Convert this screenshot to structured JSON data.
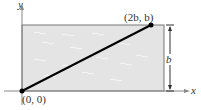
{
  "diagram": {
    "axes": {
      "x_label": "x",
      "y_label": "y"
    },
    "points": [
      {
        "label": "(0, 0)",
        "x": "0",
        "y": "0"
      },
      {
        "label": "(2b, b)",
        "x": "2b",
        "y": "b"
      }
    ],
    "dimension_label": "b",
    "colors": {
      "fill": "#e4e4e4",
      "line": "#000000",
      "axis": "#777777"
    }
  }
}
